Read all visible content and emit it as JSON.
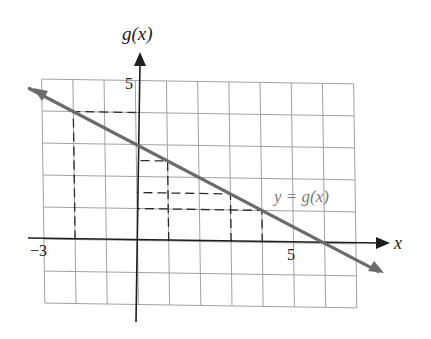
{
  "chart_data": {
    "type": "line",
    "title": "",
    "xlabel": "x",
    "ylabel": "g(x)",
    "xlim": [
      -3,
      7
    ],
    "ylim": [
      -2,
      5
    ],
    "grid": true,
    "x_tick_labels": [
      {
        "value": -3,
        "label": "−3"
      },
      {
        "value": 5,
        "label": "5"
      }
    ],
    "y_tick_labels": [
      {
        "value": 5,
        "label": "5"
      }
    ],
    "series": [
      {
        "name": "y = g(x)",
        "equation": "g(x) = -0.5x + 3",
        "x": [
          -3.4,
          7.7
        ],
        "y": [
          4.7,
          -0.85
        ],
        "points_marked": [
          {
            "x": -2,
            "y": 4
          },
          {
            "x": 6,
            "y": 0
          }
        ],
        "arrows_both_ends": true,
        "color": "#6b6b6b"
      }
    ],
    "annotations": [
      {
        "type": "label",
        "text": "y = g(x)",
        "x": 4.6,
        "y": 1.3
      },
      {
        "type": "dashed-guide",
        "x": -2,
        "y": 4
      },
      {
        "type": "dashed-guide",
        "x": 1,
        "y": 2.5
      },
      {
        "type": "dashed-guide",
        "x": 3,
        "y": 1.5
      },
      {
        "type": "dashed-guide",
        "x": 4,
        "y": 1
      }
    ]
  },
  "labels": {
    "y_axis": "g(x)",
    "x_axis": "x",
    "function": "y = g(x)",
    "x_tick_neg3": "−3",
    "x_tick_5": "5",
    "y_tick_5": "5"
  }
}
